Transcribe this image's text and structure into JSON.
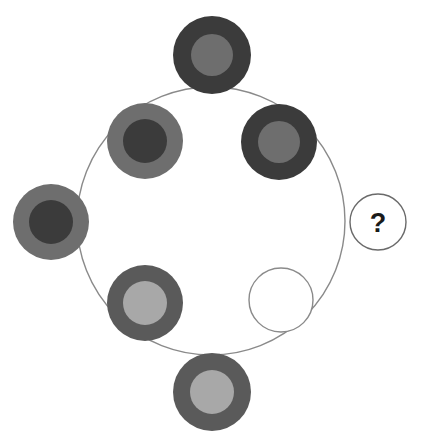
{
  "figure": {
    "background_color": "#ffffff",
    "width": 427,
    "height": 447
  },
  "palette": {
    "dark": "#3b3b3b",
    "medium_dark": "#5a5a5a",
    "medium": "#6e6e6e",
    "light": "#a8a8a8",
    "white": "#ffffff",
    "outline": "#8a8a8a"
  },
  "guide_circle": {
    "name": "large-guide-circle",
    "cx": 211,
    "cy": 221,
    "r": 134,
    "stroke": "#8a8a8a",
    "stroke_width": 1.4,
    "fill": "none"
  },
  "nodes": [
    {
      "id": "node-top",
      "label": "top",
      "clock_position": "12 o'clock",
      "cx": 212,
      "cy": 55,
      "outer_r": 39,
      "inner_r": 21,
      "outer_color": "#3b3b3b",
      "inner_color": "#6e6e6e",
      "outer_tone": "dark",
      "inner_tone": "medium",
      "empty": false
    },
    {
      "id": "node-upper-left",
      "label": "upper-left",
      "clock_position": "10 o'clock",
      "cx": 145,
      "cy": 141,
      "outer_r": 38,
      "inner_r": 22,
      "outer_color": "#6e6e6e",
      "inner_color": "#3b3b3b",
      "outer_tone": "medium",
      "inner_tone": "dark",
      "empty": false
    },
    {
      "id": "node-upper-right",
      "label": "upper-right",
      "clock_position": "2 o'clock",
      "cx": 279,
      "cy": 142,
      "outer_r": 38,
      "inner_r": 21,
      "outer_color": "#3b3b3b",
      "inner_color": "#6e6e6e",
      "outer_tone": "dark",
      "inner_tone": "medium",
      "empty": false
    },
    {
      "id": "node-left",
      "label": "left",
      "clock_position": "9 o'clock",
      "cx": 51,
      "cy": 222,
      "outer_r": 38,
      "inner_r": 22,
      "outer_color": "#6e6e6e",
      "inner_color": "#3b3b3b",
      "outer_tone": "medium",
      "inner_tone": "dark",
      "empty": false
    },
    {
      "id": "node-lower-left",
      "label": "lower-left",
      "clock_position": "7 o'clock",
      "cx": 145,
      "cy": 303,
      "outer_r": 38,
      "inner_r": 22,
      "outer_color": "#5a5a5a",
      "inner_color": "#a8a8a8",
      "outer_tone": "medium_dark",
      "inner_tone": "light",
      "empty": false
    },
    {
      "id": "node-bottom",
      "label": "bottom",
      "clock_position": "6 o'clock",
      "cx": 212,
      "cy": 392,
      "outer_r": 39,
      "inner_r": 22,
      "outer_color": "#5a5a5a",
      "inner_color": "#a8a8a8",
      "outer_tone": "medium_dark",
      "inner_tone": "light",
      "empty": false
    },
    {
      "id": "node-lower-right-empty",
      "label": "lower-right-empty-slot",
      "clock_position": "5 o'clock",
      "cx": 281,
      "cy": 300,
      "outer_r": 32,
      "inner_r": 0,
      "outer_color": "#ffffff",
      "inner_color": "#ffffff",
      "outer_tone": "white",
      "inner_tone": "none",
      "empty": true
    }
  ],
  "answer_slot": {
    "id": "question-mark-circle",
    "label": "answer-placeholder",
    "cx": 378,
    "cy": 222,
    "r": 28,
    "fill": "#ffffff",
    "stroke": "#6a6a6a",
    "stroke_width": 1.4,
    "symbol": "?"
  }
}
